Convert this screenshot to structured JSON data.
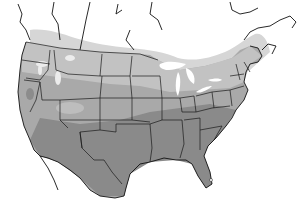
{
  "map": {
    "title": "",
    "region": "North America (contiguous US, southern Canada, northern Mexico)",
    "style": "grayscale shaded zones",
    "colors": {
      "background": "#ffffff",
      "zone_lightest": "#d4d4d4",
      "zone_light": "#bdbdbd",
      "zone_mid": "#a6a6a6",
      "zone_dark": "#8c8c8c",
      "zone_darkest": "#7a7a7a",
      "water": "#ffffff",
      "borders": "#1a1a1a"
    },
    "legend": [],
    "labels": []
  }
}
